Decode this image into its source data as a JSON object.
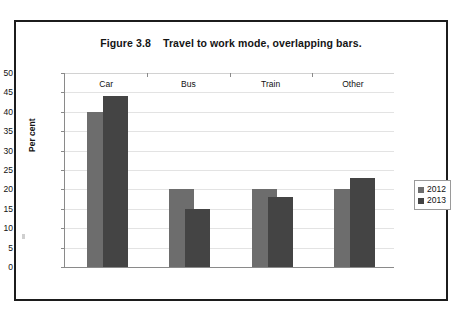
{
  "figure": {
    "title": "Figure 3.8    Travel to work mode, overlapping bars.",
    "legend_box_name": "legend"
  },
  "chart_data": {
    "type": "bar",
    "title": "Figure 3.8    Travel to work mode, overlapping bars.",
    "xlabel": "",
    "ylabel": "Per cent",
    "ylim": [
      0,
      50
    ],
    "ytick_step": 5,
    "yticks": [
      50,
      45,
      40,
      35,
      30,
      25,
      20,
      15,
      10,
      5,
      0
    ],
    "ytick_labels": [
      "50",
      "45",
      "40",
      "35",
      "30",
      "25",
      "20",
      "15",
      "10",
      "5",
      "0"
    ],
    "categories": [
      "Car",
      "Bus",
      "Train",
      "Other"
    ],
    "series": [
      {
        "name": "2012",
        "color": "#6d6d6d",
        "values": [
          40,
          20,
          20,
          20
        ]
      },
      {
        "name": "2013",
        "color": "#444444",
        "values": [
          44,
          15,
          18,
          23
        ]
      }
    ],
    "grid": true,
    "grid_axis": "y",
    "legend_position": "right",
    "bar_style": "overlapping",
    "overlap_note": "2013 bars are offset right and drawn over the 2012 bars"
  },
  "axes": {
    "y_title": "Per cent",
    "y_labels": [
      "50",
      "45",
      "40",
      "35",
      "30",
      "25",
      "20",
      "15",
      "10",
      "5",
      "0"
    ],
    "x_labels": [
      "Car",
      "Bus",
      "Train",
      "Other"
    ]
  },
  "legend": {
    "items": [
      {
        "label": "2012",
        "color": "#6d6d6d"
      },
      {
        "label": "2013",
        "color": "#444444"
      }
    ]
  }
}
